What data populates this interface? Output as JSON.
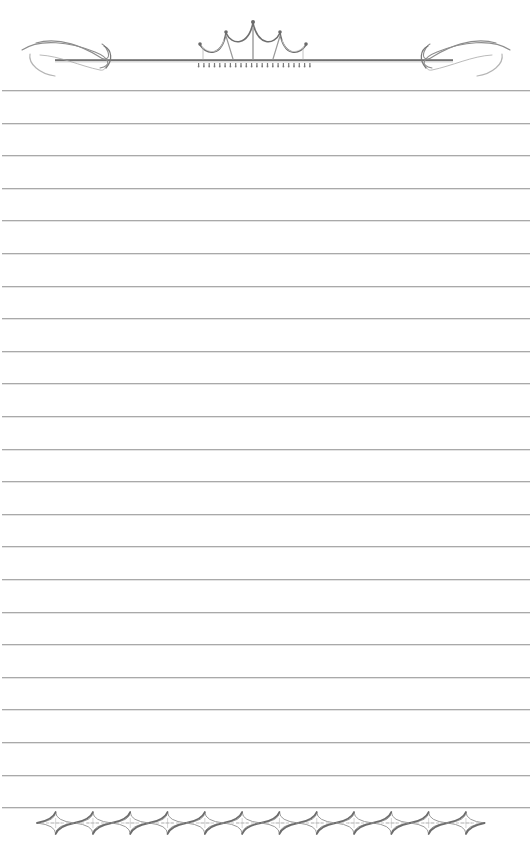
{
  "page": {
    "type": "lined stationery",
    "background_color": "#ffffff",
    "rule_color": "#a9a9a9",
    "ornament_color": "#8a8a8a",
    "rule_count": 23,
    "first_rule_y": 90,
    "rule_spacing": 32.6
  },
  "header": {
    "ornament": "crown-with-flourishes-icon",
    "left_flourish": "scroll-flourish-left-icon",
    "right_flourish": "scroll-flourish-right-icon",
    "center": "crown-icon"
  },
  "footer": {
    "ornament": "diamond-chain-border-icon",
    "diamond_count": 12
  }
}
